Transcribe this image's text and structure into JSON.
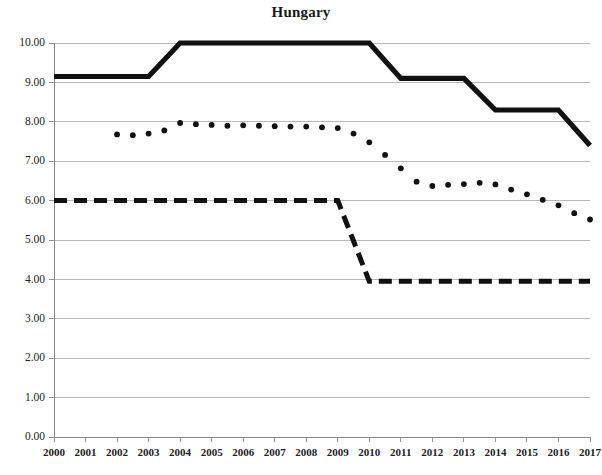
{
  "chart_data": {
    "type": "line",
    "title": "Hungary",
    "xlabel": "",
    "ylabel": "",
    "grid": true,
    "legend_position": "none",
    "xlim": [
      2000,
      2017
    ],
    "ylim": [
      0.0,
      10.0
    ],
    "ytick_labels": [
      "0.00",
      "1.00",
      "2.00",
      "3.00",
      "4.00",
      "5.00",
      "6.00",
      "7.00",
      "8.00",
      "9.00",
      "10.00"
    ],
    "ytick_values": [
      0,
      1,
      2,
      3,
      4,
      5,
      6,
      7,
      8,
      9,
      10
    ],
    "categories": [
      2000,
      2001,
      2002,
      2003,
      2004,
      2005,
      2006,
      2007,
      2008,
      2009,
      2010,
      2011,
      2012,
      2013,
      2014,
      2015,
      2016,
      2017
    ],
    "xtick_labels": [
      "2000",
      "2001",
      "2002",
      "2003",
      "2004",
      "2005",
      "2006",
      "2007",
      "2008",
      "2009",
      "2010",
      "2011",
      "2012",
      "2013",
      "2014",
      "2015",
      "2016",
      "2017"
    ],
    "series": [
      {
        "name": "solid-thick-series",
        "style": "solid",
        "color": "#111111",
        "x": [
          2000,
          2001,
          2002,
          2003,
          2004,
          2005,
          2006,
          2007,
          2008,
          2009,
          2010,
          2011,
          2012,
          2013,
          2014,
          2015,
          2016,
          2017
        ],
        "values": [
          9.15,
          9.15,
          9.15,
          9.15,
          10.0,
          10.0,
          10.0,
          10.0,
          10.0,
          10.0,
          10.0,
          9.1,
          9.1,
          9.1,
          8.3,
          8.3,
          8.3,
          7.4
        ]
      },
      {
        "name": "dashed-thick-series",
        "style": "dashed",
        "color": "#111111",
        "x": [
          2000,
          2001,
          2002,
          2003,
          2004,
          2005,
          2006,
          2007,
          2008,
          2009,
          2010,
          2011,
          2012,
          2013,
          2014,
          2015,
          2016,
          2017
        ],
        "values": [
          6.0,
          6.0,
          6.0,
          6.0,
          6.0,
          6.0,
          6.0,
          6.0,
          6.0,
          6.0,
          3.95,
          3.95,
          3.95,
          3.95,
          3.95,
          3.95,
          3.95,
          3.95
        ]
      },
      {
        "name": "dotted-series",
        "style": "dotted",
        "color": "#111111",
        "x": [
          2002.0,
          2002.5,
          2003.0,
          2003.5,
          2004.0,
          2004.5,
          2005.0,
          2005.5,
          2006.0,
          2006.5,
          2007.0,
          2007.5,
          2008.0,
          2008.5,
          2009.0,
          2009.5,
          2010.0,
          2010.5,
          2011.0,
          2011.5,
          2012.0,
          2012.5,
          2013.0,
          2013.5,
          2014.0,
          2014.5,
          2015.0,
          2015.5,
          2016.0,
          2016.5,
          2017.0
        ],
        "values": [
          7.68,
          7.66,
          7.7,
          7.78,
          7.97,
          7.94,
          7.92,
          7.9,
          7.91,
          7.9,
          7.89,
          7.88,
          7.88,
          7.86,
          7.84,
          7.7,
          7.48,
          7.16,
          6.82,
          6.48,
          6.37,
          6.4,
          6.42,
          6.45,
          6.41,
          6.28,
          6.16,
          6.02,
          5.88,
          5.68,
          5.52
        ]
      }
    ]
  }
}
